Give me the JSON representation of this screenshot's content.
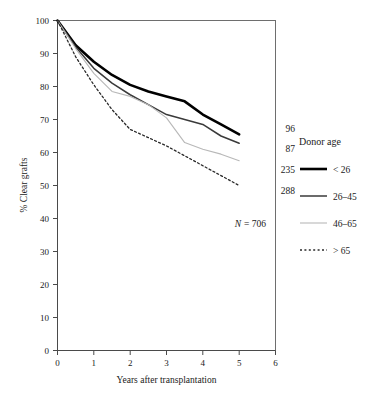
{
  "chart_data": {
    "type": "line",
    "title": "",
    "xlabel": "Years after transplantation",
    "ylabel": "% Clear grafts",
    "xlim": [
      0,
      6
    ],
    "ylim": [
      0,
      100
    ],
    "xticks": [
      "0",
      "1",
      "2",
      "3",
      "4",
      "5",
      "6"
    ],
    "yticks": [
      "0",
      "10",
      "20",
      "30",
      "40",
      "50",
      "60",
      "70",
      "80",
      "90",
      "100"
    ],
    "grid": false,
    "legend_position": "right",
    "annotation_total": "N = 706",
    "annotation_total_symbol": "N",
    "annotation_total_value": "= 706",
    "x": [
      0,
      0.5,
      1,
      1.5,
      2,
      2.5,
      3,
      3.5,
      4,
      4.5,
      5
    ],
    "series": [
      {
        "name": "< 26",
        "label": "< 26",
        "end_label": "96",
        "color": "#000000",
        "width": 2.6,
        "dash": "none",
        "values": [
          100,
          92.5,
          87.5,
          83.5,
          80.5,
          78.5,
          77.0,
          75.5,
          71.5,
          68.5,
          65.5
        ]
      },
      {
        "name": "26-45",
        "label": "26–45",
        "end_label": "87",
        "color": "#3a3a3a",
        "width": 1.5,
        "dash": "none",
        "values": [
          100,
          92.0,
          85.5,
          81.0,
          77.5,
          74.5,
          71.5,
          70.0,
          68.5,
          65.0,
          62.8
        ]
      },
      {
        "name": "46-65",
        "label": "46–65",
        "end_label": "235",
        "color": "#b8b8b8",
        "width": 1.1,
        "dash": "none",
        "values": [
          100,
          91.5,
          84.0,
          78.5,
          77.0,
          74.5,
          70.5,
          63.0,
          61.0,
          59.5,
          57.5
        ]
      },
      {
        "name": "> 65",
        "label": "> 65",
        "end_label": "288",
        "color": "#2a2a2a",
        "width": 1.3,
        "dash": "2,2.4",
        "values": [
          100,
          89.0,
          80.5,
          73.0,
          67.0,
          64.5,
          62.0,
          59.0,
          56.0,
          53.0,
          50.0
        ]
      }
    ],
    "legend": {
      "title": "Donor age",
      "entries": [
        "< 26",
        "26–45",
        "46–65",
        "> 65"
      ]
    }
  }
}
